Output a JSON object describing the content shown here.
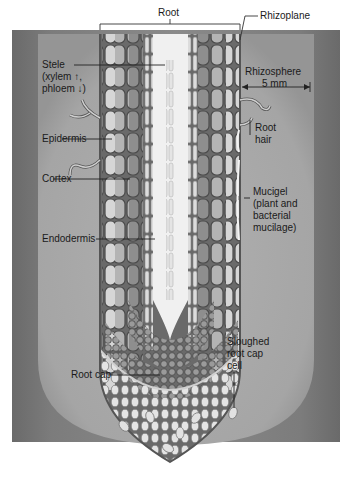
{
  "diagram": {
    "title": "Root",
    "colors": {
      "soil_dark": "#6e6e6e",
      "rhizosphere": "#a8a8a8",
      "root_outline": "#5a5a5a",
      "epidermis_cell": "#d8d8d8",
      "cortex_cell": "#b5b5b5",
      "endodermis_cell": "#8c8c8c",
      "stele_center": "#f2f2f2",
      "rootcap_cell": "#e6e6e6",
      "text": "#1a1a1a"
    },
    "labels": {
      "root": "Root",
      "rhizoplane": "Rhizoplane",
      "stele_line1": "Stele",
      "stele_line2": "(xylem ↑,",
      "stele_line3": "phloem ↓)",
      "rhizosphere": "Rhizosphere",
      "rhizosphere_width": "5 mm",
      "epidermis": "Epidermis",
      "root_hair_line1": "Root",
      "root_hair_line2": "hair",
      "cortex": "Cortex",
      "mucigel_line1": "Mucigel",
      "mucigel_line2": "(plant and",
      "mucigel_line3": "bacterial",
      "mucigel_line4": "mucilage)",
      "endodermis": "Endodermis",
      "sloughed_line1": "Sloughed",
      "sloughed_line2": "root cap",
      "sloughed_line3": "cell",
      "root_cap": "Root cap"
    }
  }
}
